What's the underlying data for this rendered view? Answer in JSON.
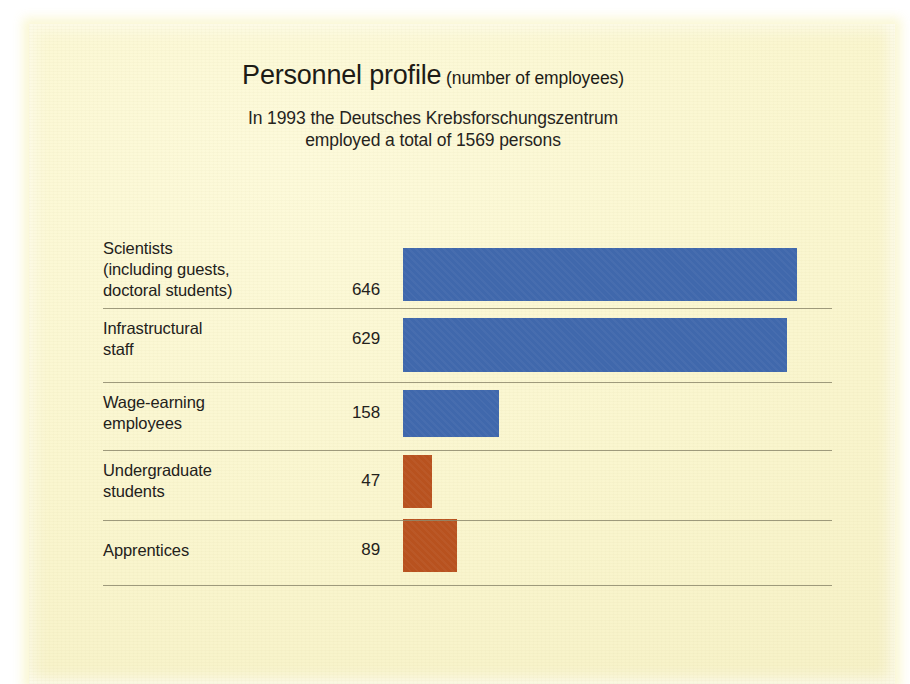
{
  "header": {
    "title_main": "Personnel profile",
    "title_sub": "(number of employees)",
    "subtitle_line1": "In 1993 the Deutsches Krebsforschungszentrum",
    "subtitle_line2": "employed a total of 1569 persons"
  },
  "colors": {
    "bar_blue": "#4068ac",
    "bar_rust": "#b8521f",
    "card_background": "#faf6cf",
    "text": "#23211b",
    "separator": "#8e8a6d"
  },
  "chart_data": {
    "type": "bar",
    "orientation": "horizontal",
    "title": "Personnel profile (number of employees)",
    "subtitle": "In 1993 the Deutsches Krebsforschungszentrum employed a total of 1569 persons",
    "xlabel": "",
    "ylabel": "",
    "xlim": [
      0,
      646
    ],
    "grid": false,
    "legend": "none",
    "total": 1569,
    "year": 1993,
    "categories": [
      "Scientists (including guests, doctoral students)",
      "Infrastructural staff",
      "Wage-earning employees",
      "Undergraduate students",
      "Apprentices"
    ],
    "values": [
      646,
      629,
      158,
      47,
      89
    ],
    "rows": [
      {
        "label": "Scientists\n(including guests,\ndoctoral students)",
        "value": "646",
        "number": 646,
        "color": "#4068ac",
        "color_name": "blue"
      },
      {
        "label": "Infrastructural\nstaff",
        "value": "629",
        "number": 629,
        "color": "#4068ac",
        "color_name": "blue"
      },
      {
        "label": "Wage-earning\nemployees",
        "value": "158",
        "number": 158,
        "color": "#4068ac",
        "color_name": "blue"
      },
      {
        "label": "Undergraduate\nstudents",
        "value": "47",
        "number": 47,
        "color": "#b8521f",
        "color_name": "rust"
      },
      {
        "label": "Apprentices",
        "value": "89",
        "number": 89,
        "color": "#b8521f",
        "color_name": "rust"
      }
    ]
  }
}
